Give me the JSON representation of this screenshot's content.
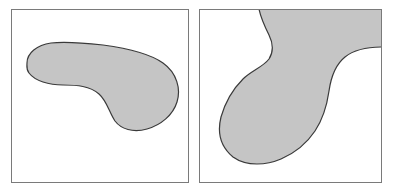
{
  "figure": {
    "width": 397,
    "height": 191,
    "background_color": "#ffffff",
    "panel_count": 2,
    "caption": "",
    "title": ""
  },
  "style": {
    "shape_fill_color": "#c5c5c5",
    "shape_stroke_color": "#3a3a3a",
    "shape_stroke_width": 1.2,
    "panel_border_color": "#7a7a7a",
    "panel_border_width": 1,
    "panel_background_color": "#ffffff"
  },
  "panels": [
    {
      "id": "panel-left",
      "label": "",
      "frame": {
        "x": 11,
        "y": 9,
        "width": 178,
        "height": 174
      },
      "shape": {
        "name": "kidney-blob",
        "description": "Bean or kidney shaped region: mostly convex outline with a single concave indentation along its lower-left side",
        "convexity": "non-convex",
        "touches_frame_edge": false,
        "bounding_box": {
          "x": 15,
          "y": 36,
          "width": 154,
          "height": 85
        },
        "path": "M 16,54 C 16,44 26,36 40,34 C 56,32 74,34 92,36 C 114,39 138,44 152,54 C 166,64 170,80 166,93 C 162,106 150,116 136,120 C 122,124 110,120 104,112 C 98,103 96,92 88,85 C 79,77 66,76 52,76 C 38,76 24,72 18,64 C 15,60 16,57 16,54 Z"
      }
    },
    {
      "id": "panel-right",
      "label": "",
      "frame": {
        "x": 199,
        "y": 9,
        "width": 183,
        "height": 174
      },
      "shape": {
        "name": "gourd-blob",
        "description": "Pear or gourd shaped region attached to the top edge of the frame, with a concave white bay on the left side and a larger concave white bay intruding from the right edge",
        "convexity": "non-convex",
        "touches_frame_edge": true,
        "bounding_box": {
          "x": 18,
          "y": 0,
          "width": 150,
          "height": 157
        },
        "path": "M 60,0 C 62,10 66,18 70,26 C 74,34 75,42 70,50 C 64,58 52,62 44,70 C 34,80 26,94 22,108 C 18,124 22,138 34,148 C 48,158 68,156 82,150 C 96,144 108,134 116,122 C 124,110 128,96 130,82 C 132,68 136,56 146,48 C 156,40 170,38 183,38 L 183,0 Z"
      }
    }
  ]
}
